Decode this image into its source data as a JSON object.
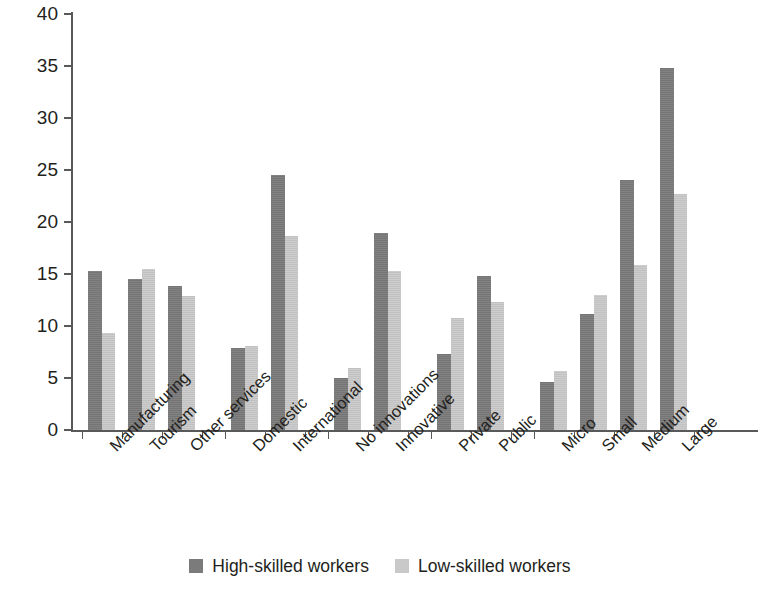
{
  "chart_data": {
    "type": "bar",
    "title": "",
    "xlabel": "",
    "ylabel": "",
    "ylim": [
      0,
      40
    ],
    "yticks": [
      0,
      5,
      10,
      15,
      20,
      25,
      30,
      35,
      40
    ],
    "grid": false,
    "legend_position": "bottom-center",
    "categories": [
      "Manufacturing",
      "Tourism",
      "Other services",
      "Domestic",
      "International",
      "No innovations",
      "Innovative",
      "Private",
      "Public",
      "Micro",
      "Small",
      "Medium",
      "Large"
    ],
    "category_groups": [
      {
        "name": "sector",
        "categories": [
          "Manufacturing",
          "Tourism",
          "Other services"
        ]
      },
      {
        "name": "market",
        "categories": [
          "Domestic",
          "International"
        ]
      },
      {
        "name": "innovation",
        "categories": [
          "No innovations",
          "Innovative"
        ]
      },
      {
        "name": "ownership",
        "categories": [
          "Private",
          "Public"
        ]
      },
      {
        "name": "size",
        "categories": [
          "Micro",
          "Small",
          "Medium",
          "Large"
        ]
      }
    ],
    "series": [
      {
        "name": "High-skilled workers",
        "color": "#7b7b7b",
        "values": [
          15.3,
          14.5,
          13.8,
          7.9,
          24.5,
          5.0,
          18.9,
          7.3,
          14.8,
          4.6,
          11.2,
          24.0,
          34.8
        ]
      },
      {
        "name": "Low-skilled workers",
        "color": "#c9c9c9",
        "values": [
          9.3,
          15.5,
          12.9,
          8.1,
          18.7,
          6.0,
          15.3,
          10.8,
          12.3,
          5.7,
          13.0,
          15.9,
          22.7
        ]
      }
    ]
  },
  "legend": {
    "entries": [
      {
        "label": "High-skilled workers",
        "color": "#7b7b7b"
      },
      {
        "label": "Low-skilled workers",
        "color": "#c9c9c9"
      }
    ]
  }
}
